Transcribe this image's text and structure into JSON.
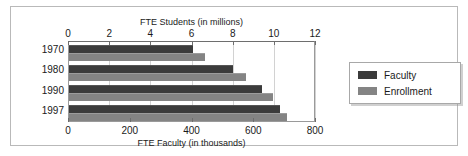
{
  "chart_data": {
    "type": "bar",
    "orientation": "horizontal",
    "title": "",
    "categories": [
      "1970",
      "1980",
      "1990",
      "1997"
    ],
    "series": [
      {
        "name": "Faculty",
        "color": "#3b3b3b",
        "axis": "bottom",
        "unit": "thousands",
        "values": [
          400,
          530,
          625,
          685
        ]
      },
      {
        "name": "Enrollment",
        "color": "#848484",
        "axis": "top",
        "unit": "millions",
        "values": [
          6.6,
          8.6,
          9.9,
          10.6
        ]
      }
    ],
    "faculty_top_axis_equivalent": [
      6.0,
      8.0,
      9.4,
      10.3
    ],
    "top_axis": {
      "label": "FTE Students (in millions)",
      "ticks": [
        "0",
        "2",
        "4",
        "6",
        "8",
        "10",
        "12"
      ],
      "tick_values": [
        0,
        2,
        4,
        6,
        8,
        10,
        12
      ],
      "min": 0,
      "max": 12
    },
    "bottom_axis": {
      "label": "FTE Faculty (in thousands)",
      "ticks": [
        "0",
        "200",
        "400",
        "600",
        "800"
      ],
      "tick_values": [
        0,
        200,
        400,
        600,
        800
      ],
      "min": 0,
      "max": 800
    },
    "legend": {
      "position": "right",
      "entries": [
        {
          "label": "Faculty",
          "color": "#3b3b3b"
        },
        {
          "label": "Enrollment",
          "color": "#848484"
        }
      ]
    },
    "grid": {
      "vertical": true,
      "horizontal": false
    }
  }
}
